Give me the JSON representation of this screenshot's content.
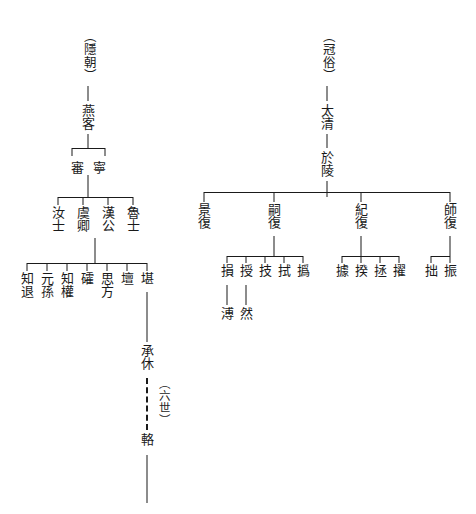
{
  "diagram": {
    "type": "genealogical-lineage-tree",
    "script": "traditional-chinese-vertical",
    "left_tree": {
      "root_paren": "（隱朝）",
      "gen1": "燕客",
      "gen2": [
        "審",
        "寧"
      ],
      "gen3": [
        "汝士",
        "虞卿",
        "漢公",
        "魯士"
      ],
      "gen4": [
        "知退",
        "元孫",
        "知權",
        "礭",
        "思方",
        "壇",
        "堪"
      ],
      "gen5": "承休",
      "gap_note": "（六世）",
      "gen6": "輅"
    },
    "right_tree": {
      "root_paren": "（冠俗）",
      "gen1": "太清",
      "gen2": "於陵",
      "gen3": [
        "景復",
        "嗣復",
        "紀復",
        "師復"
      ],
      "gen4_group_a": [
        "損",
        "授",
        "技",
        "拭",
        "撝"
      ],
      "gen4_group_b": [
        "據",
        "揆",
        "拯",
        "擢"
      ],
      "gen4_group_c": [
        "拙",
        "振"
      ],
      "gen5_group_a": [
        "溥",
        "然"
      ]
    },
    "colors": {
      "ink": "#1a1a1a",
      "background": "#ffffff"
    }
  }
}
